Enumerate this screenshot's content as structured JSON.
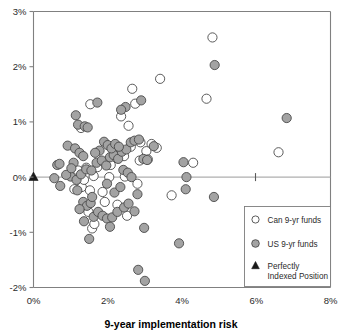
{
  "chart_data": {
    "type": "scatter",
    "title": "",
    "xlabel": "9-year implementation risk",
    "ylabel": "",
    "xlim": [
      0,
      8
    ],
    "ylim": [
      -2,
      3
    ],
    "xticks": [
      "0%",
      "2%",
      "4%",
      "6%",
      "8%"
    ],
    "xtick_values": [
      0,
      2,
      4,
      6,
      8
    ],
    "yticks": [
      "3%",
      "2%",
      "1%",
      "0%",
      "-1%",
      "-2%"
    ],
    "ytick_values": [
      3,
      2,
      1,
      0,
      -1,
      -2
    ],
    "grid": false,
    "legend_position": "bottom-right",
    "zero_reference_line": 0,
    "series": [
      {
        "name": "Can 9-yr funds",
        "marker": "open-circle",
        "color": "#ffffff",
        "edge_color": "#4a4a4a",
        "points": [
          [
            4.82,
            2.53
          ],
          [
            4.66,
            1.42
          ],
          [
            3.41,
            1.78
          ],
          [
            2.66,
            1.6
          ],
          [
            2.74,
            1.33
          ],
          [
            2.36,
            1.1
          ],
          [
            2.56,
            0.93
          ],
          [
            1.53,
            1.32
          ],
          [
            1.28,
            0.89
          ],
          [
            2.88,
            0.63
          ],
          [
            3.18,
            0.6
          ],
          [
            3.32,
            0.53
          ],
          [
            3.04,
            0.47
          ],
          [
            2.62,
            0.55
          ],
          [
            2.44,
            0.38
          ],
          [
            2.08,
            0.22
          ],
          [
            1.72,
            0.18
          ],
          [
            1.42,
            0.17
          ],
          [
            1.2,
            0.12
          ],
          [
            1.62,
            0.02
          ],
          [
            2.04,
            0.0
          ],
          [
            2.46,
            0.01
          ],
          [
            2.86,
            0.3
          ],
          [
            3.08,
            0.32
          ],
          [
            4.3,
            0.26
          ],
          [
            1.3,
            -0.18
          ],
          [
            1.1,
            -0.22
          ],
          [
            1.52,
            -0.24
          ],
          [
            1.86,
            -0.27
          ],
          [
            2.8,
            -0.12
          ],
          [
            3.72,
            -0.33
          ],
          [
            1.48,
            -0.63
          ],
          [
            1.92,
            -0.45
          ],
          [
            2.26,
            -0.5
          ],
          [
            1.58,
            -0.93
          ],
          [
            1.64,
            -0.85
          ],
          [
            6.6,
            0.45
          ],
          [
            2.52,
            -0.7
          ],
          [
            1.36,
            -0.05
          ],
          [
            2.2,
            0.47
          ]
        ]
      },
      {
        "name": "US 9-yr funds",
        "marker": "filled-circle",
        "color": "#a3a3a3",
        "edge_color": "#4a4a4a",
        "points": [
          [
            4.88,
            2.03
          ],
          [
            6.82,
            1.07
          ],
          [
            1.72,
            1.35
          ],
          [
            2.9,
            1.39
          ],
          [
            2.48,
            1.27
          ],
          [
            1.14,
            1.12
          ],
          [
            1.2,
            0.95
          ],
          [
            1.38,
            0.92
          ],
          [
            1.46,
            0.9
          ],
          [
            2.36,
            1.22
          ],
          [
            0.92,
            0.57
          ],
          [
            1.12,
            0.52
          ],
          [
            1.24,
            0.44
          ],
          [
            1.34,
            0.38
          ],
          [
            1.08,
            0.26
          ],
          [
            0.64,
            0.22
          ],
          [
            0.7,
            0.24
          ],
          [
            0.56,
            -0.02
          ],
          [
            0.72,
            -0.16
          ],
          [
            1.0,
            0.01
          ],
          [
            1.16,
            -0.05
          ],
          [
            1.28,
            0.05
          ],
          [
            1.42,
            0.14
          ],
          [
            1.56,
            0.12
          ],
          [
            1.7,
            0.26
          ],
          [
            1.84,
            0.3
          ],
          [
            1.96,
            0.21
          ],
          [
            2.06,
            0.36
          ],
          [
            2.16,
            0.4
          ],
          [
            2.28,
            0.33
          ],
          [
            2.38,
            0.46
          ],
          [
            2.5,
            0.5
          ],
          [
            2.62,
            0.63
          ],
          [
            2.72,
            0.66
          ],
          [
            2.84,
            0.68
          ],
          [
            1.9,
            0.64
          ],
          [
            2.0,
            0.58
          ],
          [
            2.1,
            0.52
          ],
          [
            2.2,
            0.6
          ],
          [
            2.3,
            0.55
          ],
          [
            1.78,
            0.48
          ],
          [
            1.66,
            0.44
          ],
          [
            2.42,
            0.13
          ],
          [
            2.54,
            0.08
          ],
          [
            2.64,
            0.0
          ],
          [
            2.96,
            0.33
          ],
          [
            3.06,
            0.31
          ],
          [
            4.04,
            0.27
          ],
          [
            4.12,
            0.0
          ],
          [
            4.1,
            -0.22
          ],
          [
            4.86,
            -0.36
          ],
          [
            1.18,
            -0.24
          ],
          [
            1.34,
            -0.45
          ],
          [
            1.44,
            -0.52
          ],
          [
            1.54,
            -0.47
          ],
          [
            1.24,
            -0.58
          ],
          [
            1.62,
            -0.72
          ],
          [
            1.74,
            -0.63
          ],
          [
            1.86,
            -0.7
          ],
          [
            1.98,
            -0.75
          ],
          [
            2.12,
            -0.73
          ],
          [
            2.26,
            -0.63
          ],
          [
            2.44,
            -0.55
          ],
          [
            2.56,
            -0.48
          ],
          [
            2.8,
            -0.31
          ],
          [
            1.5,
            -1.12
          ],
          [
            2.98,
            -0.92
          ],
          [
            3.92,
            -1.2
          ],
          [
            2.82,
            -1.68
          ],
          [
            3.0,
            -1.88
          ],
          [
            1.36,
            -0.8
          ],
          [
            1.58,
            -0.36
          ],
          [
            2.18,
            -0.28
          ],
          [
            2.34,
            -0.18
          ],
          [
            1.98,
            -0.12
          ],
          [
            0.88,
            0.04
          ],
          [
            1.02,
            0.16
          ],
          [
            2.72,
            -0.62
          ],
          [
            3.24,
            0.56
          ],
          [
            2.06,
            -0.9
          ]
        ]
      },
      {
        "name": "Perfectly Indexed Position",
        "marker": "triangle",
        "color": "#1a1a1a",
        "edge_color": "#1a1a1a",
        "points": [
          [
            0.0,
            0.0
          ]
        ]
      }
    ]
  },
  "legend": {
    "items": [
      {
        "label": "Can 9-yr funds",
        "marker": "open-circle"
      },
      {
        "label": "US 9-yr funds",
        "marker": "filled-circle"
      },
      {
        "label": "Perfectly",
        "label2": "Indexed Position",
        "marker": "triangle"
      }
    ]
  },
  "colors": {
    "us_fill": "#a3a3a3",
    "can_fill": "#ffffff",
    "marker_edge": "#4a4a4a",
    "axis": "#808080",
    "text": "#2b2b2b"
  }
}
